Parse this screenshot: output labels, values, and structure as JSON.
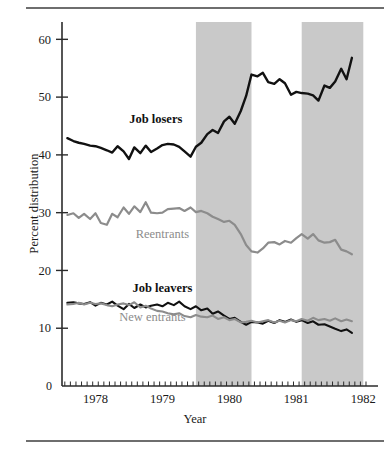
{
  "figure": {
    "ylabel": "Percent distribution",
    "xlabel": "Year",
    "top_rule_color": "#6e6e6e",
    "bottom_rule_color": "#6e6e6e"
  },
  "chart_data": {
    "type": "line",
    "title": "",
    "subtitle": "",
    "xlabel": "Year",
    "ylabel": "Percent distribution",
    "xlim": [
      1977.5,
      1982.1
    ],
    "ylim": [
      0,
      63
    ],
    "yticks": [
      0,
      10,
      20,
      30,
      40,
      50,
      60
    ],
    "ytick_labels": [
      "0",
      "10",
      "20",
      "30",
      "40",
      "50",
      "60"
    ],
    "xticks": [
      1978,
      1979,
      1980,
      1981,
      1982
    ],
    "xtick_labels": [
      "1978",
      "1979",
      "1980",
      "1981",
      "1982"
    ],
    "x_minor_tick_interval": 0.0833,
    "grid": false,
    "legend": "inline-annotations",
    "shaded_bands": [
      {
        "label": "recession",
        "x_start": 1979.5,
        "x_end": 1980.33,
        "color": "#c9c9c9"
      },
      {
        "label": "recession",
        "x_start": 1981.08,
        "x_end": 1982.0,
        "color": "#c9c9c9"
      }
    ],
    "annotations": [
      {
        "text": "Job losers",
        "x": 1978.9,
        "y": 45.6,
        "color": "#111111"
      },
      {
        "text": "Reentrants",
        "x": 1979.0,
        "y": 25.7,
        "color": "#8c8c8c"
      },
      {
        "text": "Job leavers",
        "x": 1979.0,
        "y": 16.2,
        "color": "#111111"
      },
      {
        "text": "New entrants",
        "x": 1978.85,
        "y": 11.2,
        "color": "#8c8c8c"
      }
    ],
    "x": [
      1977.58,
      1977.67,
      1977.75,
      1977.83,
      1977.92,
      1978.0,
      1978.08,
      1978.17,
      1978.25,
      1978.33,
      1978.42,
      1978.5,
      1978.58,
      1978.67,
      1978.75,
      1978.83,
      1978.92,
      1979.0,
      1979.08,
      1979.17,
      1979.25,
      1979.33,
      1979.42,
      1979.5,
      1979.58,
      1979.67,
      1979.75,
      1979.83,
      1979.92,
      1980.0,
      1980.08,
      1980.17,
      1980.25,
      1980.33,
      1980.42,
      1980.5,
      1980.58,
      1980.67,
      1980.75,
      1980.83,
      1980.92,
      1981.0,
      1981.08,
      1981.17,
      1981.25,
      1981.33,
      1981.42,
      1981.5,
      1981.58,
      1981.67,
      1981.75,
      1981.83
    ],
    "series": [
      {
        "name": "Job losers",
        "color": "#111111",
        "width": 2.4,
        "values": [
          42.9,
          42.4,
          42.1,
          41.9,
          41.6,
          41.5,
          41.2,
          40.8,
          40.4,
          41.5,
          40.6,
          39.3,
          41.3,
          40.3,
          41.6,
          40.5,
          41.1,
          41.7,
          41.9,
          41.8,
          41.4,
          40.6,
          39.7,
          41.4,
          42.1,
          43.6,
          44.3,
          43.8,
          45.8,
          46.6,
          45.4,
          47.6,
          50.2,
          53.9,
          53.6,
          54.2,
          52.6,
          52.3,
          53.1,
          52.4,
          50.4,
          50.9,
          50.7,
          50.6,
          50.3,
          49.4,
          52.0,
          51.6,
          52.7,
          54.9,
          53.1,
          56.8
        ]
      },
      {
        "name": "Reentrants",
        "color": "#8c8c8c",
        "width": 2.2,
        "values": [
          29.6,
          29.9,
          29.1,
          29.8,
          28.9,
          29.9,
          28.2,
          27.9,
          29.8,
          29.2,
          30.9,
          29.8,
          31.1,
          30.1,
          31.8,
          30.0,
          29.9,
          30.0,
          30.6,
          30.7,
          30.8,
          30.3,
          30.9,
          30.1,
          30.3,
          29.9,
          29.3,
          28.9,
          28.4,
          28.6,
          27.9,
          26.3,
          24.4,
          23.3,
          23.1,
          23.8,
          24.8,
          24.9,
          24.5,
          25.1,
          24.8,
          25.6,
          26.3,
          25.5,
          26.3,
          25.2,
          24.8,
          24.9,
          25.3,
          23.6,
          23.3,
          22.8
        ]
      },
      {
        "name": "Job leavers",
        "color": "#111111",
        "width": 2.1,
        "values": [
          14.4,
          14.5,
          14.3,
          14.2,
          14.5,
          13.9,
          14.4,
          14.1,
          14.6,
          13.9,
          13.3,
          14.2,
          13.5,
          14.1,
          13.6,
          13.9,
          14.1,
          13.8,
          14.4,
          14.0,
          14.6,
          13.8,
          13.3,
          13.8,
          13.1,
          13.4,
          12.5,
          12.9,
          12.2,
          11.6,
          11.8,
          11.1,
          10.6,
          11.1,
          11.0,
          10.8,
          11.3,
          10.9,
          11.4,
          11.1,
          11.5,
          11.1,
          11.4,
          10.9,
          11.2,
          10.6,
          10.7,
          10.3,
          9.9,
          9.5,
          9.8,
          9.2
        ]
      },
      {
        "name": "New entrants",
        "color": "#8c8c8c",
        "width": 2.1,
        "values": [
          14.1,
          14.2,
          14.4,
          14.1,
          14.4,
          14.2,
          14.3,
          14.0,
          13.8,
          14.1,
          14.3,
          14.0,
          14.5,
          13.6,
          13.9,
          13.4,
          13.0,
          12.9,
          12.6,
          12.4,
          12.6,
          12.1,
          11.9,
          12.3,
          12.0,
          11.9,
          12.2,
          11.6,
          11.9,
          11.4,
          11.6,
          11.0,
          11.1,
          11.3,
          11.0,
          11.2,
          11.4,
          11.0,
          11.3,
          11.0,
          11.4,
          11.2,
          11.6,
          11.3,
          11.8,
          11.4,
          11.6,
          11.3,
          11.7,
          11.2,
          11.5,
          11.2
        ]
      }
    ]
  }
}
